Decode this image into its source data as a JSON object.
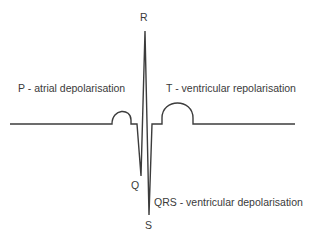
{
  "diagram": {
    "title": "",
    "colors": {
      "trace": "#3c3c3c",
      "text": "#3a3a3a",
      "background": "#ffffff"
    },
    "labels": {
      "r": "R",
      "q": "Q",
      "s": "S",
      "p_wave": "P - atrial depolarisation",
      "t_wave": "T - ventricular repolarisation",
      "qrs": "QRS - ventricular depolarisation"
    },
    "waveform": {
      "type": "ECG single heartbeat",
      "baseline_y": 124,
      "points": {
        "start": [
          10,
          124
        ],
        "p_wave": {
          "from": 112,
          "to": 131,
          "peak_y": 113
        },
        "q": [
          141,
          176
        ],
        "r": [
          145,
          31
        ],
        "s": [
          149,
          215
        ],
        "t_wave": {
          "from": 162,
          "to": 193,
          "peak_y": 104
        },
        "end": [
          295,
          124
        ]
      }
    }
  }
}
